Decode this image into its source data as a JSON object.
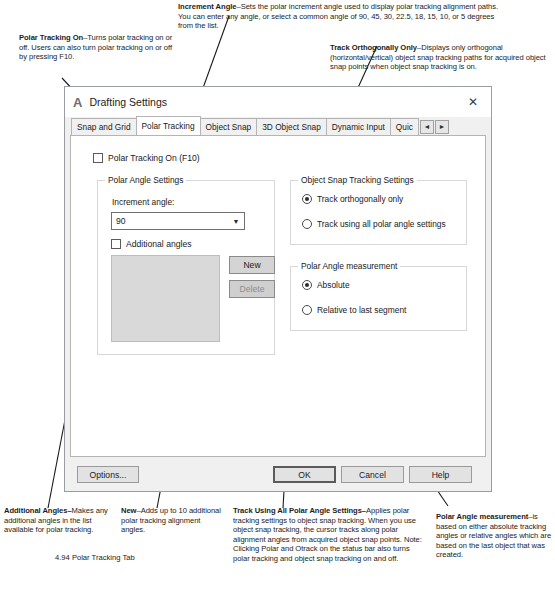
{
  "annotations": {
    "top_truncated": "",
    "increment_angle": {
      "term": "Increment Angle",
      "body": "–Sets the polar increment angle used to display polar tracking alignment paths. You can enter any angle, or select a common angle of 90, 45, 30, 22.5, 18, 15, 10, or 5 degrees from the list."
    },
    "polar_tracking_on": {
      "term": "Polar Tracking On",
      "body": "–Turns polar tracking on or off. Users can also turn polar tracking on or off by pressing F10."
    },
    "track_orthogonally": {
      "term": "Track Orthogonally Only",
      "body": "–Displays only orthogonal (horizontal/vertical) object snap tracking paths for acquired object snap points when object snap tracking is on."
    },
    "additional_angles": {
      "term": "Additional Angles–",
      "body": "Makes any additional angles in the list available for polar tracking."
    },
    "new_button": {
      "term": "New",
      "body": "–Adds up to 10 additional polar tracking alignment angles."
    },
    "track_using_all": {
      "term": "Track Using All Polar Angle Settings–",
      "body": "Applies polar tracking settings to object snap tracking. When you use object snap tracking, the cursor tracks along polar alignment angles from acquired object snap points. Note: Clicking Polar and Otrack on the status bar also turns polar tracking and object snap tracking on and off."
    },
    "polar_angle_measurement": {
      "term": "Polar Angle measurement",
      "body": "–is based on either absolute tracking angles or relative angles which are based on the last object that was created."
    }
  },
  "figure_caption": "4.94  Polar Tracking Tab",
  "dialog": {
    "logo": "A",
    "title": "Drafting Settings",
    "close_icon": "✕",
    "tabs": [
      {
        "label": "Snap and Grid",
        "active": false
      },
      {
        "label": "Polar Tracking",
        "active": true
      },
      {
        "label": "Object Snap",
        "active": false
      },
      {
        "label": "3D Object Snap",
        "active": false
      },
      {
        "label": "Dynamic Input",
        "active": false
      },
      {
        "label": "Quic",
        "active": false
      }
    ],
    "tab_scroll_left": "◄",
    "tab_scroll_right": "►",
    "polar_tracking_on": {
      "label": "Polar Tracking On (F10)",
      "checked": false
    },
    "polar_angle_settings": {
      "title": "Polar Angle Settings",
      "increment_angle_label": "Increment angle:",
      "increment_angle_value": "90",
      "increment_angle_options": [
        "90",
        "45",
        "30",
        "22.5",
        "18",
        "15",
        "10",
        "5"
      ],
      "dropdown_icon": "⌵",
      "additional_angles_label": "Additional angles",
      "additional_angles_checked": false,
      "angles_list": [],
      "new_button": "New",
      "delete_button": "Delete",
      "delete_disabled": true
    },
    "object_snap_tracking_settings": {
      "title": "Object Snap Tracking Settings",
      "options": [
        {
          "label": "Track orthogonally only",
          "selected": true
        },
        {
          "label": "Track using all polar angle settings",
          "selected": false
        }
      ]
    },
    "polar_angle_measurement": {
      "title": "Polar Angle measurement",
      "options": [
        {
          "label": "Absolute",
          "selected": true
        },
        {
          "label": "Relative to last segment",
          "selected": false
        }
      ]
    },
    "footer": {
      "options_button": "Options...",
      "ok_button": "OK",
      "cancel_button": "Cancel",
      "help_button": "Help"
    }
  }
}
